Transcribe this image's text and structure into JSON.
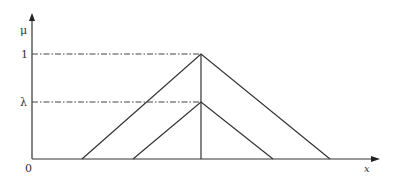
{
  "diagram": {
    "type": "fuzzy-membership-triangles",
    "axes": {
      "y_label": "μ",
      "x_label": "x",
      "origin_label": "0",
      "y_ticks": [
        {
          "label": "1",
          "level": 1
        },
        {
          "label": "λ",
          "level": "lambda"
        }
      ]
    },
    "shapes": [
      {
        "name": "outer-triangle",
        "left": 82,
        "peak": 201,
        "right": 330,
        "height_label": "1"
      },
      {
        "name": "inner-triangle",
        "left": 133,
        "peak": 201,
        "right": 273,
        "height_label": "λ"
      }
    ],
    "colors": {
      "line": "#333333",
      "background": "#ffffff"
    }
  }
}
